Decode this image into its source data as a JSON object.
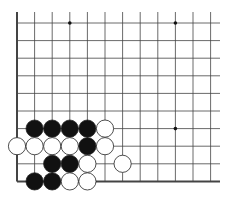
{
  "diagram": {
    "type": "go-board-fragment",
    "visible_cols": 12,
    "visible_rows": 10,
    "edges": [
      "left",
      "bottom"
    ],
    "colors": {
      "background": "#ffffff",
      "line": "#444444",
      "black_stone": "#111111",
      "white_stone": "#ffffff",
      "stone_outline": "#222222"
    },
    "star_points": [
      {
        "col": 3,
        "row": 0
      },
      {
        "col": 9,
        "row": 0
      },
      {
        "col": 9,
        "row": 6
      }
    ],
    "stones": [
      {
        "color": "black",
        "col": 1,
        "row": 6
      },
      {
        "color": "black",
        "col": 2,
        "row": 6
      },
      {
        "color": "black",
        "col": 3,
        "row": 6
      },
      {
        "color": "black",
        "col": 4,
        "row": 6
      },
      {
        "color": "white",
        "col": 5,
        "row": 6
      },
      {
        "color": "white",
        "col": 0,
        "row": 7
      },
      {
        "color": "white",
        "col": 1,
        "row": 7
      },
      {
        "color": "white",
        "col": 2,
        "row": 7
      },
      {
        "color": "white",
        "col": 3,
        "row": 7
      },
      {
        "color": "black",
        "col": 4,
        "row": 7
      },
      {
        "color": "white",
        "col": 5,
        "row": 7
      },
      {
        "color": "black",
        "col": 2,
        "row": 8
      },
      {
        "color": "black",
        "col": 3,
        "row": 8
      },
      {
        "color": "white",
        "col": 4,
        "row": 8
      },
      {
        "color": "white",
        "col": 6,
        "row": 8
      },
      {
        "color": "black",
        "col": 1,
        "row": 9
      },
      {
        "color": "black",
        "col": 2,
        "row": 9
      },
      {
        "color": "white",
        "col": 3,
        "row": 9
      },
      {
        "color": "white",
        "col": 4,
        "row": 9
      }
    ]
  }
}
